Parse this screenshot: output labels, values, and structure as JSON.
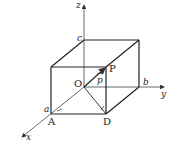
{
  "diagram": {
    "type": "3d-coordinate-box",
    "axes": {
      "x": "x",
      "y": "y",
      "z": "z"
    },
    "points": {
      "origin": "O",
      "p": "P",
      "a_point": "A",
      "d_point": "D"
    },
    "intercepts": {
      "a": "a",
      "b": "b",
      "c": "c"
    },
    "vector_label": "p",
    "colors": {
      "line": "#222222",
      "axis": "#444444"
    }
  }
}
